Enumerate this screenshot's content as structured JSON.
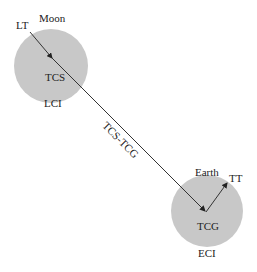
{
  "diagram": {
    "moon": {
      "name": "Moon",
      "time_scale_top": "LT",
      "time_scale_center": "TCS",
      "frame": "LCI"
    },
    "earth": {
      "name": "Earth",
      "time_scale_top": "TT",
      "time_scale_center": "TCG",
      "frame": "ECI"
    },
    "link_label": "TCS-TCG",
    "colors": {
      "body_fill": "#c8c8c8",
      "line": "#333333",
      "text": "#222222"
    }
  }
}
